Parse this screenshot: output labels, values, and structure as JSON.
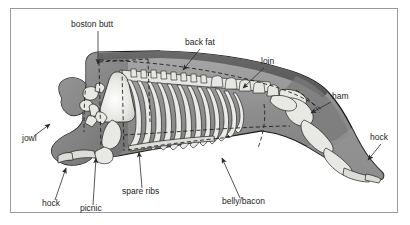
{
  "figure": {
    "border_color": "#9a9a9a",
    "background": "#ffffff"
  },
  "palette": {
    "body_light": "#b4b4b4",
    "body_mid": "#8e8e8e",
    "body_dark": "#6f6f6f",
    "backfat": "#5f5f5f",
    "bone": "#e8e8e4",
    "outline": "#1b1b1b",
    "label_text": "#1d1d1d",
    "leader": "#2b2b2b"
  },
  "labels": [
    {
      "id": "boston-butt",
      "text": "boston butt",
      "x": 71,
      "y": 27,
      "anchor": "start"
    },
    {
      "id": "back-fat",
      "text": "back fat",
      "x": 185,
      "y": 45,
      "anchor": "start"
    },
    {
      "id": "loin",
      "text": "loin",
      "x": 261,
      "y": 64,
      "anchor": "start"
    },
    {
      "id": "ham",
      "text": "ham",
      "x": 332,
      "y": 99,
      "anchor": "start"
    },
    {
      "id": "hock-rear",
      "text": "hock",
      "x": 370,
      "y": 140,
      "anchor": "start"
    },
    {
      "id": "jowl",
      "text": "jowl",
      "x": 22,
      "y": 141,
      "anchor": "start"
    },
    {
      "id": "hock-front",
      "text": "hock",
      "x": 42,
      "y": 206,
      "anchor": "start"
    },
    {
      "id": "picnic",
      "text": "picnic",
      "x": 80,
      "y": 211,
      "anchor": "start"
    },
    {
      "id": "spare-ribs",
      "text": "spare ribs",
      "x": 122,
      "y": 194,
      "anchor": "start"
    },
    {
      "id": "belly-bacon",
      "text": "belly/bacon",
      "x": 222,
      "y": 204,
      "anchor": "start"
    }
  ],
  "cuts": [
    "boston butt",
    "picnic",
    "jowl",
    "hock",
    "back fat",
    "loin",
    "spare ribs",
    "belly/bacon",
    "ham"
  ]
}
